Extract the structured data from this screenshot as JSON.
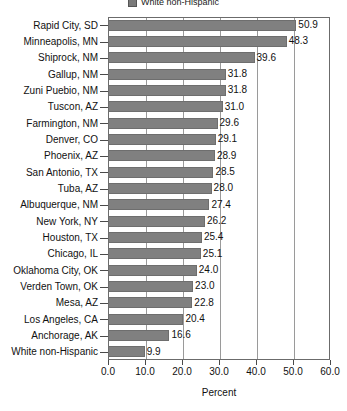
{
  "legend": {
    "entries": [
      {
        "label": "White non-Hispanic",
        "color": "#808080",
        "swatch_name": "legend-swatch-white-non-hispanic"
      }
    ]
  },
  "axis": {
    "x_title": "Percent",
    "x_ticks": [
      "0.0",
      "10.0",
      "20.0",
      "30.0",
      "40.0",
      "50.0",
      "60.0"
    ]
  },
  "chart_data": {
    "type": "bar",
    "orientation": "horizontal",
    "title": "",
    "subtitle": "",
    "xlabel": "Percent",
    "ylabel": "",
    "xlim": [
      0,
      60
    ],
    "xticks": [
      0,
      10,
      20,
      30,
      40,
      50,
      60
    ],
    "grid": true,
    "grid_axis": "x",
    "legend": [
      "White non-Hispanic"
    ],
    "legend_position": "top-center",
    "bar_color": "#808080",
    "categories": [
      "Rapid City, SD",
      "Minneapolis, MN",
      "Shiprock, NM",
      "Gallup, NM",
      "Zuni Puebio, NM",
      "Tuscon, AZ",
      "Farmington, NM",
      "Denver, CO",
      "Phoenix, AZ",
      "San Antonio, TX",
      "Tuba, AZ",
      "Albuquerque, NM",
      "New York, NY",
      "Houston, TX",
      "Chicago, IL",
      "Oklahoma City, OK",
      "Verden Town, OK",
      "Mesa, AZ",
      "Los Angeles, CA",
      "Anchorage, AK",
      "White non-Hispanic"
    ],
    "values": [
      50.9,
      48.3,
      39.6,
      31.8,
      31.8,
      31.0,
      29.6,
      29.1,
      28.9,
      28.5,
      28.0,
      27.4,
      26.2,
      25.4,
      25.1,
      24.0,
      23.0,
      22.8,
      20.4,
      16.6,
      9.9
    ],
    "value_labels": [
      "50.9",
      "48.3",
      "39.6",
      "31.8",
      "31.8",
      "31.0",
      "29.6",
      "29.1",
      "28.9",
      "28.5",
      "28.0",
      "27.4",
      "26.2",
      "25.4",
      "25.1",
      "24.0",
      "23.0",
      "22.8",
      "20.4",
      "16.6",
      "9.9"
    ]
  }
}
